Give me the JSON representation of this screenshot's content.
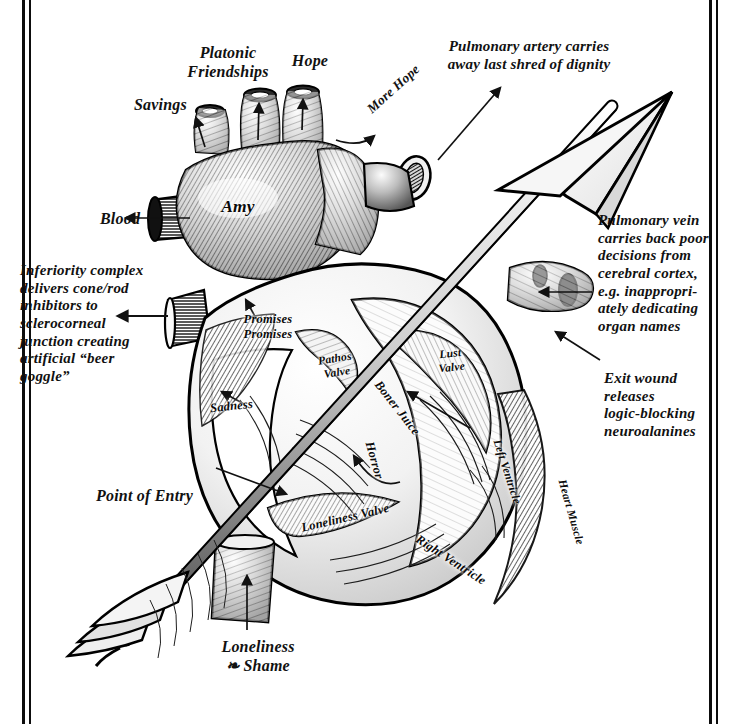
{
  "figure": {
    "style": "engraved crosshatch anatomical illustration, black ink on white",
    "border_color": "#0d0d0d",
    "ink_color": "#111111",
    "paper_color": "#ffffff"
  },
  "labels": {
    "platonic_friendships": "Platonic\nFriendships",
    "hope": "Hope",
    "savings": "Savings",
    "more_hope": "More Hope",
    "pulmonary_artery": "Pulmonary artery carries\naway last shred of dignity",
    "blood": "Blood",
    "amy": "Amy",
    "promises_promises": "Promises\nPromises",
    "inferiority_complex": "Inferiority complex\ndelivers cone/rod\ninhibitors to\nsclerocorneal\njunction creating\nartificial “beer\ngoggle”",
    "pulmonary_vein": "Pulmonary vein\ncarries back poor\ndecisions from\ncerebral cortex,\ne.g. inappropri-\nately dedicating\norgan names",
    "exit_wound": "Exit wound\nreleases\nlogic-blocking\nneuroalanines",
    "pathos_valve": "Pathos\nValve",
    "lust_valve": "Lust\nValve",
    "boner_juice": "Boner Juice",
    "sadness": "Sadness",
    "horror": "Horror",
    "left_ventricle": "Left Ventricle",
    "heart_muscle": "Heart Muscle",
    "point_of_entry": "Point of Entry",
    "loneliness_valve": "Loneliness Valve",
    "right_ventricle": "Right Ventricle",
    "loneliness_and_shame": "Loneliness\n❧ Shame"
  },
  "annotations": {
    "arrow_description": "A large fletched arrow pierces the heart diagonally from lower-left to upper-right",
    "leader_lines": [
      "Savings → left pulmonary vessel stump",
      "Platonic Friendships → centre vessel stump",
      "Hope → right vessel stump",
      "More Hope → aortic arch branch",
      "Pulmonary artery → cut vessel mouth",
      "Blood → superior vena cava stump",
      "Promises Promises → interior chamber wall",
      "Inferiority complex → left coronary vessel stump",
      "Pulmonary vein → right vessel group",
      "Exit wound → arrow exit on upper right",
      "Point of Entry → arrow entry at lower left",
      "Sadness → septum surface",
      "Boner Juice → left ventricle interior",
      "Horror → interior trabeculae",
      "Loneliness & Shame → inferior vena cava stump"
    ]
  }
}
